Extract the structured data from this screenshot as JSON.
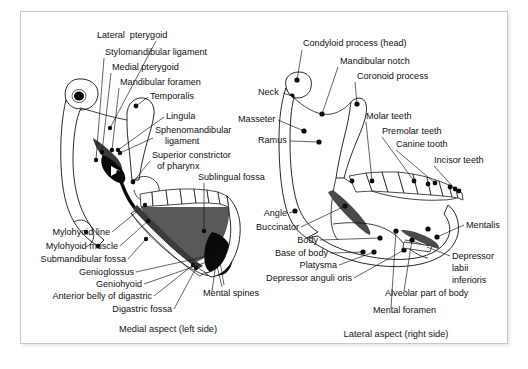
{
  "figure": {
    "background_color": "#ffffff",
    "frame_border_color": "#c9c9c9",
    "ink_color": "#111111"
  },
  "panels": [
    {
      "id": "medial-left",
      "caption": "Medial aspect (left side)",
      "caption_pos": {
        "x": 168,
        "y": 332
      },
      "labels": [
        {
          "name": "lateral-pterygoid",
          "text": "Lateral  pterygoid",
          "x": 97,
          "y": 38,
          "anchor": "start",
          "leader": [
            [
              156,
              41
            ],
            [
              110,
              128
            ]
          ],
          "dot": [
            110,
            128
          ]
        },
        {
          "name": "stylomandibular-ligament",
          "text": "Stylomandibular ligament",
          "x": 105,
          "y": 55,
          "anchor": "start",
          "leader": [
            [
              104,
              58
            ],
            [
              96,
              160
            ]
          ],
          "dot": [
            96,
            160
          ]
        },
        {
          "name": "medial-pterygoid",
          "text": "Medial pterygoid",
          "x": 112,
          "y": 70,
          "anchor": "start",
          "leader": [
            [
              111,
              73
            ],
            [
              102,
              152
            ]
          ],
          "dot": [
            102,
            152
          ]
        },
        {
          "name": "mandibular-foramen",
          "text": "Mandibular foramen",
          "x": 120,
          "y": 85,
          "anchor": "start",
          "leader": [
            [
              119,
              88
            ],
            [
              112,
              150
            ]
          ],
          "dot": [
            112,
            150
          ]
        },
        {
          "name": "temporalis",
          "text": "Temporalis",
          "x": 150,
          "y": 99,
          "anchor": "start",
          "leader": [
            [
              148,
              97
            ],
            [
              136,
              106
            ]
          ],
          "dot": [
            136,
            106
          ]
        },
        {
          "name": "lingula",
          "text": "Lingula",
          "x": 166,
          "y": 119,
          "anchor": "start",
          "leader": [
            [
              164,
              117
            ],
            [
              118,
              150
            ]
          ],
          "dot": [
            118,
            150
          ]
        },
        {
          "name": "sphenomandibular-ligament-1",
          "text": "Sphenomandibular",
          "x": 155,
          "y": 133,
          "anchor": "start",
          "leader": [
            [
              153,
              138
            ],
            [
              120,
              153
            ]
          ],
          "dot": [
            120,
            153
          ]
        },
        {
          "name": "sphenomandibular-ligament-2",
          "text": "ligament",
          "x": 165,
          "y": 144,
          "anchor": "start"
        },
        {
          "name": "superior-constrictor-1",
          "text": "Superior constrictor",
          "x": 152,
          "y": 158,
          "anchor": "start",
          "leader": [
            [
              150,
              161
            ],
            [
              133,
              182
            ]
          ],
          "dot": [
            133,
            182
          ]
        },
        {
          "name": "superior-constrictor-2",
          "text": "of pharynx",
          "x": 157,
          "y": 169,
          "anchor": "start"
        },
        {
          "name": "sublingual-fossa",
          "text": "Sublingual fossa",
          "x": 198,
          "y": 180,
          "anchor": "start",
          "leader": [
            [
              204,
              183
            ],
            [
              204,
              231
            ]
          ],
          "dot": [
            204,
            231
          ]
        },
        {
          "name": "mylohyoid-line",
          "text": "Mylohyoid line",
          "x": 110,
          "y": 235,
          "anchor": "end",
          "leader": [
            [
              112,
              232
            ],
            [
              145,
              205
            ]
          ],
          "dot": [
            145,
            205
          ]
        },
        {
          "name": "mylohyoid-muscle",
          "text": "Mylohyoid muscle",
          "x": 118,
          "y": 249,
          "anchor": "end",
          "leader": [
            [
              120,
              246
            ],
            [
              148,
              221
            ]
          ],
          "dot": [
            148,
            221
          ]
        },
        {
          "name": "submandibular-fossa",
          "text": "Submandibular fossa",
          "x": 126,
          "y": 262,
          "anchor": "end",
          "leader": [
            [
              128,
              259
            ],
            [
              146,
              239
            ]
          ],
          "dot": [
            146,
            239
          ]
        },
        {
          "name": "genioglossus",
          "text": "Genioglossus",
          "x": 134,
          "y": 275,
          "anchor": "end",
          "leader": [
            [
              136,
              272
            ],
            [
              208,
              256
            ]
          ],
          "dot": [
            208,
            256
          ]
        },
        {
          "name": "geniohyoid",
          "text": "Geniohyoid",
          "x": 142,
          "y": 287,
          "anchor": "end",
          "leader": [
            [
              144,
              284
            ],
            [
              207,
              262
            ]
          ],
          "dot": [
            207,
            262
          ]
        },
        {
          "name": "anterior-belly-of-digastric",
          "text": "Anterior belly of digastric",
          "x": 152,
          "y": 299,
          "anchor": "end",
          "leader": [
            [
              154,
              296
            ],
            [
              193,
              265
            ]
          ],
          "dot": [
            193,
            265
          ]
        },
        {
          "name": "digastric-fossa",
          "text": "Digastric fossa",
          "x": 172,
          "y": 312,
          "anchor": "end",
          "leader": [
            [
              174,
              309
            ],
            [
              196,
              268
            ]
          ],
          "dot": [
            196,
            268
          ]
        },
        {
          "name": "mental-spines",
          "text": "Mental spines",
          "x": 203,
          "y": 296,
          "anchor": "start",
          "leader": [
            [
              212,
              291
            ],
            [
              218,
              250
            ]
          ],
          "dot": [
            218,
            250
          ]
        }
      ]
    },
    {
      "id": "lateral-right",
      "caption": "Lateral aspect (right side)",
      "caption_pos": {
        "x": 396,
        "y": 337
      },
      "labels": [
        {
          "name": "condyloid-process-head",
          "text": "Condyloid process (head)",
          "x": 303,
          "y": 46,
          "anchor": "start",
          "leader": [
            [
              302,
              50
            ],
            [
              297,
              80
            ]
          ],
          "dot": [
            297,
            80
          ]
        },
        {
          "name": "neck",
          "text": "Neck",
          "x": 258,
          "y": 95,
          "anchor": "start",
          "leader": [
            [
              283,
              93
            ],
            [
              292,
              96
            ]
          ],
          "dot": [
            292,
            96
          ]
        },
        {
          "name": "mandibular-notch",
          "text": "Mandibular notch",
          "x": 340,
          "y": 64,
          "anchor": "start",
          "leader": [
            [
              338,
              67
            ],
            [
              322,
              114
            ]
          ],
          "dot": [
            322,
            114
          ]
        },
        {
          "name": "coronoid-process",
          "text": "Coronoid process",
          "x": 357,
          "y": 79,
          "anchor": "start",
          "leader": [
            [
              355,
              82
            ],
            [
              357,
              104
            ]
          ],
          "dot": [
            357,
            104
          ]
        },
        {
          "name": "masseter",
          "text": "Masseter",
          "x": 238,
          "y": 122,
          "anchor": "start",
          "leader": [
            [
              278,
              120
            ],
            [
              304,
              131
            ]
          ],
          "dot": [
            304,
            131
          ]
        },
        {
          "name": "ramus",
          "text": "Ramus",
          "x": 258,
          "y": 143,
          "anchor": "start",
          "leader": [
            [
              290,
              141
            ],
            [
              319,
              142
            ]
          ],
          "dot": [
            319,
            142
          ]
        },
        {
          "name": "molar-teeth",
          "text": "Molar teeth",
          "x": 366,
          "y": 119,
          "anchor": "start",
          "leader": [
            [
              366,
              122
            ],
            [
              372,
              181
            ]
          ],
          "dot": [
            372,
            181
          ]
        },
        {
          "name": "premolar-teeth",
          "text": "Premolar teeth",
          "x": 382,
          "y": 134,
          "anchor": "start",
          "leader": [
            [
              382,
              137
            ],
            [
              414,
              181
            ]
          ],
          "dot": [
            414,
            181
          ]
        },
        {
          "name": "canine-tooth",
          "text": "Canine tooth",
          "x": 396,
          "y": 147,
          "anchor": "start",
          "leader": [
            [
              396,
              150
            ],
            [
              435,
              183
            ]
          ],
          "dot": [
            435,
            183
          ]
        },
        {
          "name": "incisor-teeth",
          "text": "Incisor teeth",
          "x": 434,
          "y": 163,
          "anchor": "start",
          "leader": [
            [
              434,
              166
            ],
            [
              455,
              189
            ]
          ],
          "dot": [
            455,
            189
          ]
        },
        {
          "name": "angle",
          "text": "Angle",
          "x": 287,
          "y": 216,
          "anchor": "end",
          "leader": [
            [
              289,
              213
            ],
            [
              295,
              211
            ]
          ],
          "dot": [
            295,
            211
          ]
        },
        {
          "name": "buccinator",
          "text": "Buccinator",
          "x": 299,
          "y": 230,
          "anchor": "end",
          "leader": [
            [
              301,
              227
            ],
            [
              345,
              206
            ]
          ],
          "dot": [
            345,
            206
          ]
        },
        {
          "name": "body",
          "text": "Body",
          "x": 318,
          "y": 243,
          "anchor": "end",
          "leader": [
            [
              320,
              240
            ],
            [
              380,
              238
            ]
          ],
          "dot": [
            380,
            238
          ]
        },
        {
          "name": "base-of-body",
          "text": "Base of body",
          "x": 328,
          "y": 256,
          "anchor": "end",
          "leader": [
            [
              330,
              253
            ],
            [
              363,
              252
            ]
          ],
          "dot": [
            363,
            252
          ]
        },
        {
          "name": "platysma",
          "text": "Platysma",
          "x": 337,
          "y": 268,
          "anchor": "end",
          "leader": [
            [
              339,
              265
            ],
            [
              374,
              252
            ]
          ],
          "dot": [
            374,
            252
          ]
        },
        {
          "name": "depressor-anguli-oris",
          "text": "Depressor anguli oris",
          "x": 352,
          "y": 281,
          "anchor": "end",
          "leader": [
            [
              354,
              278
            ],
            [
              404,
              250
            ]
          ],
          "dot": [
            404,
            250
          ]
        },
        {
          "name": "mentalis",
          "text": "Mentalis",
          "x": 466,
          "y": 228,
          "anchor": "start",
          "leader": [
            [
              464,
              225
            ],
            [
              437,
              237
            ]
          ],
          "dot": [
            437,
            237
          ]
        },
        {
          "name": "depressor-labii-inferioris-1",
          "text": "Depressor",
          "x": 452,
          "y": 259,
          "anchor": "start",
          "leader": [
            [
              450,
              256
            ],
            [
              427,
              247
            ]
          ],
          "dot": [
            427,
            247
          ]
        },
        {
          "name": "depressor-labii-inferioris-2",
          "text": "labii",
          "x": 452,
          "y": 271,
          "anchor": "start"
        },
        {
          "name": "depressor-labii-inferioris-3",
          "text": "inferioris",
          "x": 452,
          "y": 283,
          "anchor": "start"
        },
        {
          "name": "alveolar-part-of-body",
          "text": "Alveolar part of body",
          "x": 385,
          "y": 296,
          "anchor": "start",
          "leader": [
            [
              404,
              291
            ],
            [
              412,
              240
            ]
          ],
          "dot": [
            412,
            240
          ]
        },
        {
          "name": "mental-foramen",
          "text": "Mental foramen",
          "x": 373,
          "y": 313,
          "anchor": "start",
          "leader": [
            [
              391,
              308
            ],
            [
              396,
              231
            ]
          ],
          "dot": [
            396,
            231
          ]
        }
      ]
    }
  ]
}
